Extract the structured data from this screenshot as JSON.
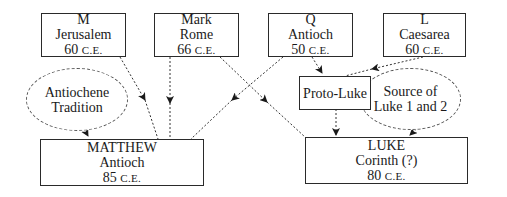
{
  "sources": [
    {
      "id": "M",
      "name": "M",
      "place": "Jerusalem",
      "year": "60",
      "era": "C.E."
    },
    {
      "id": "Mark",
      "name": "Mark",
      "place": "Rome",
      "year": "66",
      "era": "C.E."
    },
    {
      "id": "Q",
      "name": "Q",
      "place": "Antioch",
      "year": "50",
      "era": "C.E."
    },
    {
      "id": "L",
      "name": "L",
      "place": "Caesarea",
      "year": "60",
      "era": "C.E."
    }
  ],
  "traditions": [
    {
      "id": "antiochene",
      "line1": "Antiochene",
      "line2": "Tradition"
    },
    {
      "id": "luke-source",
      "line1": "Source of",
      "line2": "Luke 1 and 2"
    }
  ],
  "intermediate": {
    "proto_luke": "Proto-Luke"
  },
  "gospels": [
    {
      "id": "matthew",
      "name": "MATTHEW",
      "place": "Antioch",
      "year": "85",
      "era": "C.E."
    },
    {
      "id": "luke",
      "name": "LUKE",
      "place": "Corinth (?)",
      "year": "80",
      "era": "C.E."
    }
  ],
  "edges": [
    {
      "from": "M",
      "to": "MATTHEW"
    },
    {
      "from": "Mark",
      "to": "MATTHEW"
    },
    {
      "from": "Q",
      "to": "MATTHEW"
    },
    {
      "from": "Mark",
      "to": "LUKE"
    },
    {
      "from": "Q",
      "to": "Proto-Luke"
    },
    {
      "from": "L",
      "to": "Proto-Luke"
    },
    {
      "from": "Antiochene Tradition",
      "to": "MATTHEW"
    },
    {
      "from": "Proto-Luke",
      "to": "LUKE"
    },
    {
      "from": "Source of Luke 1 and 2",
      "to": "LUKE"
    }
  ]
}
